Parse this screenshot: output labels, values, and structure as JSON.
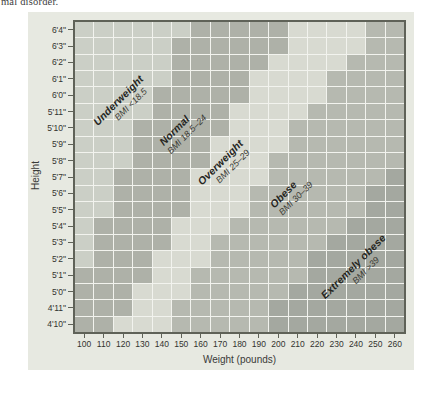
{
  "page": {
    "fragment_text": "mal disorder."
  },
  "chart_data": {
    "type": "heatmap",
    "title": "",
    "xlabel": "Weight (pounds)",
    "ylabel": "Height",
    "x_tick_labels": [
      "100",
      "110",
      "120",
      "130",
      "140",
      "150",
      "160",
      "170",
      "180",
      "190",
      "200",
      "210",
      "220",
      "230",
      "240",
      "250",
      "260"
    ],
    "y_tick_labels": [
      "6'4\"",
      "6'3\"",
      "6'2\"",
      "6'1\"",
      "6'0\"",
      "5'11\"",
      "5'10\"",
      "5'9\"",
      "5'8\"",
      "5'7\"",
      "5'6\"",
      "5'5\"",
      "5'4\"",
      "5'3\"",
      "5'2\"",
      "5'1\"",
      "5'0\"",
      "4'11\"",
      "4'10\""
    ],
    "categories": [
      {
        "code": "U",
        "name": "Underweight",
        "range_label": "BMI <18.5",
        "color": "#cbcfc6"
      },
      {
        "code": "N",
        "name": "Normal",
        "range_label": "BMI 18.5–24",
        "color": "#aeb1a8"
      },
      {
        "code": "O",
        "name": "Overweight",
        "range_label": "BMI 25–29",
        "color": "#d8dad1"
      },
      {
        "code": "B",
        "name": "Obese",
        "range_label": "BMI 30–39",
        "color": "#b6b9b0"
      },
      {
        "code": "E",
        "name": "Extremely obese",
        "range_label": "BMI >39",
        "color": "#a4a8a0"
      }
    ],
    "grid_rows_top_to_bottom": [
      "UUUUUUNNNNNOOOOBB",
      "UUUUUNNNNNNOOOOBB",
      "UUUUUNNNNNOOOOBBB",
      "UUUUUNNNNOOOOBBBB",
      "UUUUNNNNNOOOOBBBB",
      "UUUUNNNNOOOOBBBBB",
      "UUUNNNNNOOOBBBBBB",
      "UUUNNNNOOOOBBBBBB",
      "UUUNNNNOOOBBBBBBB",
      "UUNNNNOOOOBBBBBBE",
      "UUNNNNOOOBBBBBBEE",
      "UUNNNNOOOBBBBBBEE",
      "UNNNNOOOBBBBBBEEE",
      "UNNNNOOBBBBBBEEEE",
      "UNNNOOOBBBBBEEEEE",
      "NNNNOOBBBBBBEEEEE",
      "NNNOOOBBBBBEEEEEE",
      "NNNOOBBBBBEEEEEEE",
      "NNOOOBBBBBEEEEEEE"
    ],
    "layout": {
      "grid_on": true,
      "x_range_pounds": [
        100,
        260
      ],
      "y_range": [
        "4'10\"",
        "6'4\""
      ],
      "legend": "diagonal in-plot band labels"
    }
  },
  "colors": {
    "panel_bg": "#e7e9e1",
    "grid_line": "#f2f3ee",
    "plot_border": "#5f6258",
    "axis_text": "#33332f"
  }
}
